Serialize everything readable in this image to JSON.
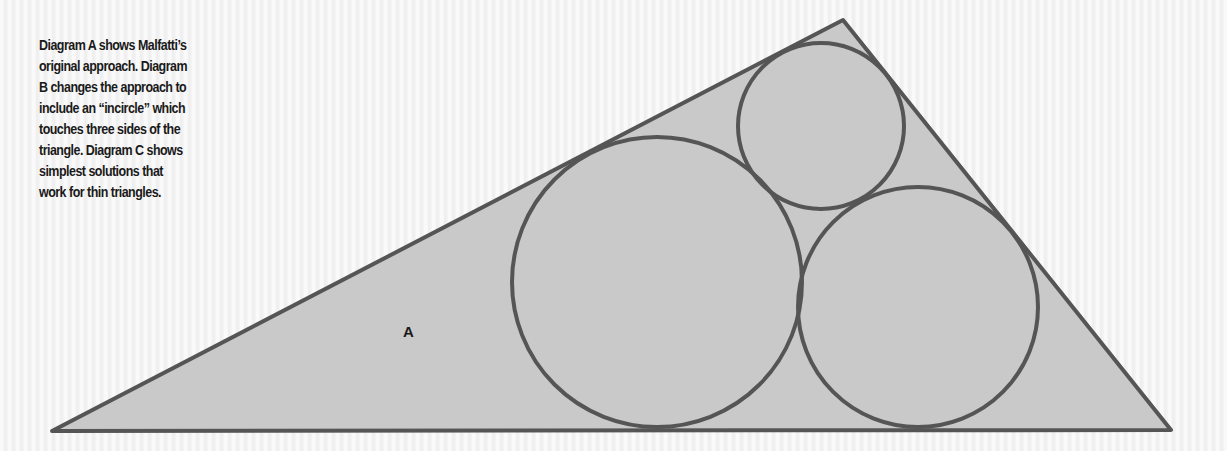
{
  "caption": {
    "lines": [
      "Diagram A shows Malfatti’s",
      "original approach. Diagram",
      "B changes the approach to",
      "include an “incircle” which",
      "touches three sides of the",
      "triangle. Diagram C shows",
      "simplest solutions that",
      "work for thin triangles."
    ]
  },
  "diagram": {
    "label": "A",
    "colors": {
      "stroke": "#555555",
      "fill": "#c9c9c9",
      "background": "#f3f3f3"
    },
    "triangle": {
      "vertices": [
        [
          52,
          431
        ],
        [
          843,
          20
        ],
        [
          1171,
          430
        ]
      ]
    },
    "circles": [
      {
        "name": "large-circle",
        "cx": 657,
        "cy": 282,
        "r": 145
      },
      {
        "name": "top-circle",
        "cx": 821,
        "cy": 126,
        "r": 83
      },
      {
        "name": "right-circle",
        "cx": 918,
        "cy": 307,
        "r": 120
      }
    ]
  }
}
